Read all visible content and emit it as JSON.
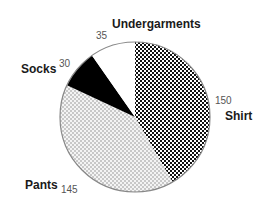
{
  "chart_data": {
    "type": "pie",
    "title": "",
    "start_angle_deg": 0,
    "direction": "clockwise",
    "categories": [
      "Shirt",
      "Pants",
      "Socks",
      "Undergarments"
    ],
    "values": [
      150,
      145,
      30,
      35
    ],
    "slices": [
      {
        "label": "Shirt",
        "value": 150,
        "pattern": "checker-black",
        "color": "#111111"
      },
      {
        "label": "Pants",
        "value": 145,
        "pattern": "dots-grey",
        "color": "#bdbdbd"
      },
      {
        "label": "Socks",
        "value": 30,
        "pattern": "solid-black",
        "color": "#000000"
      },
      {
        "label": "Undergarments",
        "value": 35,
        "pattern": "solid-white",
        "color": "#ffffff"
      }
    ],
    "legend": "none (direct labels)",
    "outline_color": "#888888"
  },
  "labels": {
    "shirt": {
      "name": "Shirt",
      "value": "150"
    },
    "pants": {
      "name": "Pants",
      "value": "145"
    },
    "socks": {
      "name": "Socks",
      "value": "30"
    },
    "undergarments": {
      "name": "Undergarments",
      "value": "35"
    }
  }
}
